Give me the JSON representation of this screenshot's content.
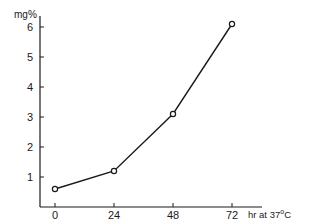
{
  "chart_data": {
    "type": "line",
    "title": "",
    "xlabel": "hr at 37°C",
    "ylabel": "mg%",
    "x": [
      0,
      24,
      48,
      72
    ],
    "series": [
      {
        "name": "mg%",
        "values": [
          0.6,
          1.2,
          3.1,
          6.1
        ],
        "marker": "open-circle"
      }
    ],
    "x_ticks": [
      "0",
      "24",
      "48",
      "72"
    ],
    "y_ticks": [
      "1",
      "2",
      "3",
      "4",
      "5",
      "6"
    ],
    "xlim": [
      0,
      80
    ],
    "ylim": [
      0,
      6.4
    ],
    "grid": false,
    "legend": "none"
  },
  "labels": {
    "ylabel": "mg%",
    "xlabel_prefix": "hr at 37",
    "xlabel_deg": "o",
    "xlabel_suffix": "C"
  },
  "colors": {
    "ink": "#1a1a1a",
    "background": "#ffffff"
  }
}
